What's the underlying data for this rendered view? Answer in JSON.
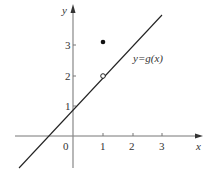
{
  "figure": {
    "axes": {
      "x_label": "x",
      "y_label": "y",
      "origin_label": "0",
      "x_ticks": [
        "1",
        "2",
        "3"
      ],
      "y_ticks": [
        "1",
        "2",
        "3"
      ]
    },
    "function_label": "y=g(x)",
    "line": {
      "equation": "y = x + 1",
      "from": [
        -1.8,
        -0.8
      ],
      "to": [
        3.0,
        4.0
      ]
    },
    "open_point": {
      "x": 1,
      "y": 2
    },
    "filled_point": {
      "x": 1,
      "y": 3
    },
    "colors": {
      "axis": "#777777",
      "line": "#222222",
      "point": "#111111"
    }
  }
}
